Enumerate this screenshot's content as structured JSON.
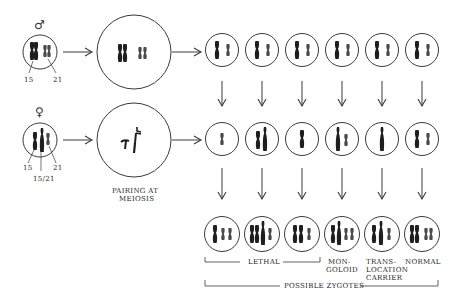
{
  "parents": {
    "male": {
      "symbol": "♂",
      "labels": [
        "15",
        "21"
      ]
    },
    "female": {
      "symbol": "♀",
      "labels": [
        "15",
        "21",
        "15/21"
      ]
    }
  },
  "meiosis": {
    "pairing_label_line1": "PAIRING AT",
    "pairing_label_line2": "MEIOSIS"
  },
  "zygotes": {
    "outcomes": [
      {
        "label_lines": [
          "LETHAL"
        ],
        "group": "lethal"
      },
      {
        "label_lines": [
          "MON-",
          "GOLOID"
        ]
      },
      {
        "label_lines": [
          "TRANS-",
          "LOCATION",
          "CARRIER"
        ]
      },
      {
        "label_lines": [
          "NORMAL"
        ]
      }
    ],
    "lethal_label": "LETHAL",
    "mongoloid_line1": "MON-",
    "mongoloid_line2": "GOLOID",
    "translocation_line1": "TRANS-",
    "translocation_line2": "LOCATION",
    "translocation_line3": "CARRIER",
    "normal_label": "NORMAL",
    "possible_zygotes_label": "POSSIBLE ZYGOTES"
  },
  "colors": {
    "line": "#3a3a3a",
    "chromosome": "#1e1e1e",
    "chromosome_light": "#555555",
    "background": "#ffffff"
  }
}
